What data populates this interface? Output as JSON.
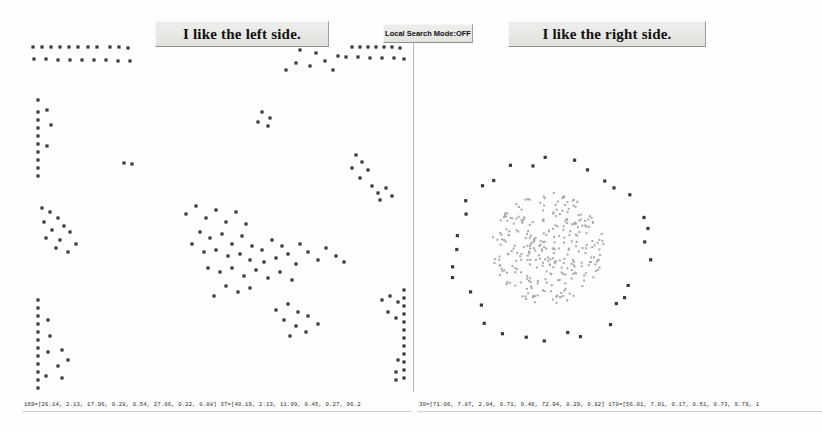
{
  "window": {
    "width": 822,
    "height": 432,
    "background": "#fefefe"
  },
  "left_panel": {
    "title": "I like the left side."
  },
  "center": {
    "mode_label": "Local Search Mode:OFF"
  },
  "right_panel": {
    "title": "I like the right side."
  },
  "status": {
    "left": "169=[26.14, 2.13, 17.96, 0.28, 0.54, 27.06, 0.22, 0.88]   37=[40.19, 2.13, 11.99, 0.45, 0.27, 96.2",
    "right": "30=[71.06, 7.87, 2.04, 0.71, 0.46, 72.94, 0.29, 0.92]   170=[56.01, 7.01, 0.17, 0.51, 0.73, 9.79, 1"
  },
  "colors": {
    "marker_dark": "#3a3a3a",
    "marker_light": "#a8a8a8",
    "divider": "#b9b9b9",
    "banner_face": "#e9e9e6",
    "text": "#111111"
  },
  "chart_data": {
    "type": "scatter",
    "title": "",
    "panels": [
      {
        "name": "left",
        "title": "I like the left side.",
        "marker": "square",
        "marker_size": 3.2,
        "color": "#3a3a3a",
        "xlim": [
          0,
          413
        ],
        "ylim": [
          0,
          432
        ],
        "grid": false,
        "legend": null,
        "point_count": 168,
        "points": [
          [
            33,
            47
          ],
          [
            42,
            47
          ],
          [
            51,
            47
          ],
          [
            60,
            47
          ],
          [
            69,
            47
          ],
          [
            78,
            47
          ],
          [
            88,
            47
          ],
          [
            97,
            47
          ],
          [
            110,
            47
          ],
          [
            119,
            47
          ],
          [
            128,
            48
          ],
          [
            34,
            59
          ],
          [
            46,
            59
          ],
          [
            58,
            60
          ],
          [
            70,
            60
          ],
          [
            82,
            60
          ],
          [
            94,
            60
          ],
          [
            106,
            60
          ],
          [
            118,
            61
          ],
          [
            130,
            61
          ],
          [
            300,
            50
          ],
          [
            316,
            53
          ],
          [
            325,
            61
          ],
          [
            338,
            56
          ],
          [
            310,
            66
          ],
          [
            333,
            70
          ],
          [
            286,
            70
          ],
          [
            296,
            63
          ],
          [
            352,
            47
          ],
          [
            360,
            47
          ],
          [
            368,
            47
          ],
          [
            376,
            47
          ],
          [
            384,
            47
          ],
          [
            392,
            47
          ],
          [
            400,
            48
          ],
          [
            346,
            57
          ],
          [
            358,
            57
          ],
          [
            370,
            58
          ],
          [
            382,
            58
          ],
          [
            394,
            58
          ],
          [
            404,
            59
          ],
          [
            38,
            100
          ],
          [
            38,
            112
          ],
          [
            38,
            120
          ],
          [
            47,
            110
          ],
          [
            38,
            128
          ],
          [
            38,
            136
          ],
          [
            51,
            125
          ],
          [
            38,
            144
          ],
          [
            38,
            152
          ],
          [
            47,
            146
          ],
          [
            38,
            160
          ],
          [
            38,
            168
          ],
          [
            38,
            176
          ],
          [
            124,
            163
          ],
          [
            132,
            164
          ],
          [
            262,
            112
          ],
          [
            270,
            118
          ],
          [
            258,
            122
          ],
          [
            268,
            126
          ],
          [
            356,
            155
          ],
          [
            362,
            162
          ],
          [
            352,
            168
          ],
          [
            368,
            170
          ],
          [
            360,
            178
          ],
          [
            372,
            186
          ],
          [
            378,
            193
          ],
          [
            386,
            188
          ],
          [
            380,
            200
          ],
          [
            392,
            196
          ],
          [
            42,
            208
          ],
          [
            50,
            212
          ],
          [
            44,
            222
          ],
          [
            58,
            218
          ],
          [
            52,
            230
          ],
          [
            64,
            226
          ],
          [
            46,
            238
          ],
          [
            60,
            240
          ],
          [
            70,
            232
          ],
          [
            56,
            248
          ],
          [
            68,
            252
          ],
          [
            76,
            244
          ],
          [
            186,
            214
          ],
          [
            196,
            206
          ],
          [
            206,
            218
          ],
          [
            216,
            210
          ],
          [
            226,
            222
          ],
          [
            236,
            212
          ],
          [
            246,
            224
          ],
          [
            200,
            232
          ],
          [
            210,
            238
          ],
          [
            222,
            234
          ],
          [
            232,
            244
          ],
          [
            242,
            236
          ],
          [
            252,
            246
          ],
          [
            192,
            244
          ],
          [
            204,
            252
          ],
          [
            216,
            250
          ],
          [
            228,
            256
          ],
          [
            240,
            254
          ],
          [
            250,
            260
          ],
          [
            262,
            250
          ],
          [
            272,
            240
          ],
          [
            282,
            246
          ],
          [
            264,
            262
          ],
          [
            276,
            258
          ],
          [
            288,
            254
          ],
          [
            296,
            264
          ],
          [
            300,
            244
          ],
          [
            308,
            252
          ],
          [
            318,
            260
          ],
          [
            326,
            248
          ],
          [
            336,
            256
          ],
          [
            344,
            262
          ],
          [
            208,
            268
          ],
          [
            220,
            272
          ],
          [
            232,
            268
          ],
          [
            244,
            276
          ],
          [
            256,
            270
          ],
          [
            268,
            278
          ],
          [
            280,
            272
          ],
          [
            292,
            280
          ],
          [
            226,
            286
          ],
          [
            238,
            292
          ],
          [
            250,
            288
          ],
          [
            214,
            296
          ],
          [
            276,
            310
          ],
          [
            288,
            304
          ],
          [
            298,
            312
          ],
          [
            284,
            320
          ],
          [
            296,
            326
          ],
          [
            308,
            316
          ],
          [
            318,
            324
          ],
          [
            306,
            332
          ],
          [
            290,
            336
          ],
          [
            382,
            300
          ],
          [
            390,
            296
          ],
          [
            398,
            302
          ],
          [
            404,
            290
          ],
          [
            404,
            298
          ],
          [
            404,
            306
          ],
          [
            404,
            314
          ],
          [
            404,
            322
          ],
          [
            404,
            330
          ],
          [
            404,
            338
          ],
          [
            404,
            346
          ],
          [
            396,
            318
          ],
          [
            388,
            312
          ],
          [
            404,
            354
          ],
          [
            404,
            362
          ],
          [
            398,
            360
          ],
          [
            404,
            370
          ],
          [
            396,
            372
          ],
          [
            404,
            378
          ],
          [
            396,
            380
          ],
          [
            38,
            300
          ],
          [
            38,
            308
          ],
          [
            38,
            316
          ],
          [
            38,
            324
          ],
          [
            48,
            320
          ],
          [
            38,
            332
          ],
          [
            38,
            340
          ],
          [
            50,
            336
          ],
          [
            38,
            348
          ],
          [
            38,
            356
          ],
          [
            48,
            352
          ],
          [
            62,
            350
          ],
          [
            38,
            364
          ],
          [
            38,
            372
          ],
          [
            58,
            366
          ],
          [
            68,
            360
          ],
          [
            38,
            380
          ],
          [
            46,
            376
          ],
          [
            62,
            378
          ],
          [
            38,
            388
          ]
        ]
      },
      {
        "name": "right",
        "title": "I like the right side.",
        "marker": "square",
        "marker_size": 2.0,
        "grid": false,
        "legend": null,
        "xlim": [
          414,
          822
        ],
        "ylim": [
          0,
          432
        ],
        "core": {
          "description": "dense disc of light-gray points",
          "center": [
            548,
            248
          ],
          "radius": 56,
          "color": "#a8a8a8",
          "point_count": 300
        },
        "ring": {
          "description": "sparse ring of dark points",
          "center": [
            548,
            248
          ],
          "radius": 96,
          "color": "#3a3a3a",
          "point_count": 32,
          "marker_size": 3.2
        }
      }
    ]
  }
}
